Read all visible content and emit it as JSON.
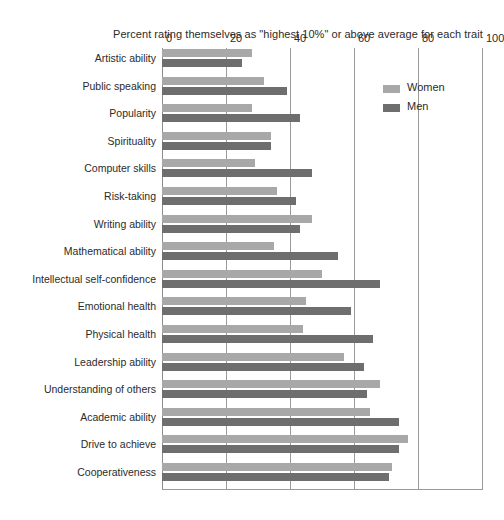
{
  "chart_data": {
    "type": "bar",
    "orientation": "horizontal",
    "grouped": true,
    "title": "Percent rating themselves as \"highest 10%\" or above average for each trait",
    "xlabel": "",
    "ylabel": "",
    "xlim": [
      0,
      100
    ],
    "xticks": [
      0,
      20,
      40,
      60,
      80,
      100
    ],
    "xtick_labels": [
      "0",
      "20",
      "40",
      "60",
      "80",
      "100"
    ],
    "grid": true,
    "grid_axis": "x",
    "legend_position": "top-right",
    "categories": [
      "Artistic ability",
      "Public speaking",
      "Popularity",
      "Spirituality",
      "Computer skills",
      "Risk-taking",
      "Writing ability",
      "Mathematical ability",
      "Intellectual self-confidence",
      "Emotional health",
      "Physical health",
      "Leadership ability",
      "Understanding of others",
      "Academic ability",
      "Drive to achieve",
      "Cooperativeness"
    ],
    "series": [
      {
        "name": "Women",
        "color": "#a8a8a8",
        "values": [
          28,
          32,
          28,
          34,
          29,
          36,
          47,
          35,
          50,
          45,
          44,
          57,
          68,
          65,
          77,
          72
        ]
      },
      {
        "name": "Men",
        "color": "#6e6e6e",
        "values": [
          25,
          39,
          43,
          34,
          47,
          42,
          43,
          55,
          68,
          59,
          66,
          63,
          64,
          74,
          74,
          71
        ]
      }
    ]
  },
  "legend": {
    "entries": [
      {
        "label": "Women",
        "swatch_class": "women"
      },
      {
        "label": "Men",
        "swatch_class": "men"
      }
    ]
  },
  "colors": {
    "women": "#a8a8a8",
    "men": "#6e6e6e",
    "gridline": "#9a9a9a",
    "text": "#2b2b2b",
    "background": "#ffffff"
  }
}
